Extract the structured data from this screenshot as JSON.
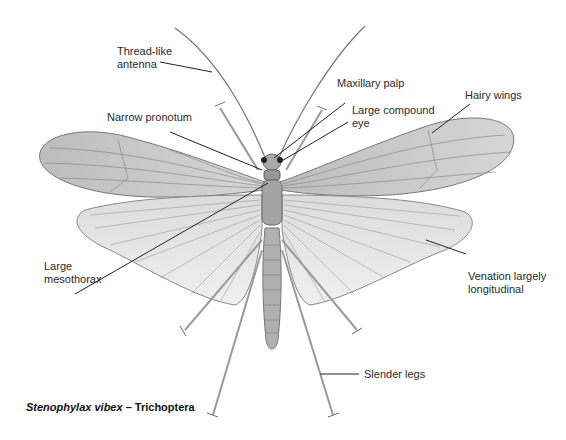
{
  "diagram": {
    "caption": {
      "species": "Stenophylax vibex",
      "separator": " – ",
      "order": "Trichoptera"
    },
    "labels": [
      {
        "id": "antenna",
        "text": "Thread-like\nantenna"
      },
      {
        "id": "maxillary-palp",
        "text": "Maxillary palp"
      },
      {
        "id": "compound-eye",
        "text": "Large compound\neye"
      },
      {
        "id": "hairy-wings",
        "text": "Hairy wings"
      },
      {
        "id": "pronotum",
        "text": "Narrow pronotum"
      },
      {
        "id": "mesothorax",
        "text": "Large\nmesothorax"
      },
      {
        "id": "venation",
        "text": "Venation largely\nlongitudinal"
      },
      {
        "id": "legs",
        "text": "Slender legs"
      }
    ]
  },
  "colors": {
    "background": "#ffffff",
    "wing_fill": "#c9c9c9",
    "hindwing_fill": "#e2e2e2",
    "vein": "#8a8a8a",
    "body": "#a8a8a8",
    "leader_line": "#222222",
    "text": "#2a2a2a"
  }
}
